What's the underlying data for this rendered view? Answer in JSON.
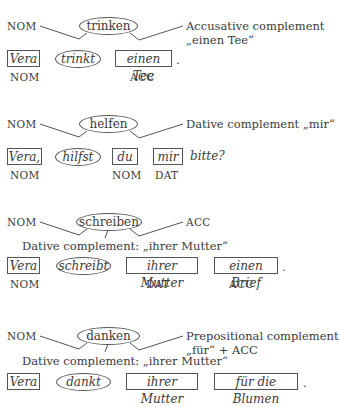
{
  "diagrams": [
    {
      "verb": "trinken",
      "left_label": "NOM",
      "right_label_line1": "Accusative complement",
      "right_label_line2": "„einen Tee“",
      "sentence": [
        {
          "text": "Vera",
          "shape": "box",
          "case": "NOM"
        },
        {
          "text": "trinkt",
          "shape": "ellipse",
          "case": ""
        },
        {
          "text": "einen Tee",
          "shape": "box",
          "case": "ACC"
        }
      ],
      "end": "."
    },
    {
      "verb": "helfen",
      "left_label": "NOM",
      "right_label_line1": "Dative complement „mir“",
      "sentence": [
        {
          "text": "Vera,",
          "shape": "box",
          "case": "NOM"
        },
        {
          "text": "hilfst",
          "shape": "ellipse",
          "case": ""
        },
        {
          "text": "du",
          "shape": "box",
          "case": "NOM"
        },
        {
          "text": "mir",
          "shape": "box",
          "case": "DAT"
        }
      ],
      "end": "bitte?"
    },
    {
      "verb": "schreiben",
      "left_label": "NOM",
      "right_label_line1": "ACC",
      "middle_label": "Dative complement: „ihrer Mutter“",
      "sentence": [
        {
          "text": "Vera",
          "shape": "box",
          "case": "NOM"
        },
        {
          "text": "schreibt",
          "shape": "ellipse",
          "case": ""
        },
        {
          "text": "ihrer Mutter",
          "shape": "box",
          "case": "DAT"
        },
        {
          "text": "einen Brief",
          "shape": "box",
          "case": "ACC"
        }
      ],
      "end": "."
    },
    {
      "verb": "danken",
      "left_label": "NOM",
      "right_label_line1": "Prepositional complement",
      "right_label_line2": "„für“ + ACC",
      "middle_label": "Dative complement: „ihrer Mutter“",
      "sentence": [
        {
          "text": "Vera",
          "shape": "box",
          "case": ""
        },
        {
          "text": "dankt",
          "shape": "ellipse",
          "case": ""
        },
        {
          "text": "ihrer Mutter",
          "shape": "box",
          "case": ""
        },
        {
          "text": "für die Blumen",
          "shape": "box",
          "case": ""
        }
      ],
      "end": "."
    }
  ]
}
